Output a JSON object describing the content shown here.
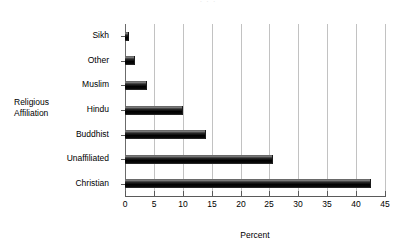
{
  "top_sliver_text": ". . .",
  "axes": {
    "y_title_line1": "Religious",
    "y_title_line2": "Affiliation",
    "x_title": "Percent"
  },
  "chart_data": {
    "type": "bar",
    "orientation": "horizontal",
    "title": "",
    "subtitle": "",
    "xlabel": "Percent",
    "ylabel": "Religious Affiliation",
    "categories": [
      "Sikh",
      "Other",
      "Muslim",
      "Hindu",
      "Buddhist",
      "Unaffiliated",
      "Christian"
    ],
    "values": [
      0.7,
      1.8,
      3.8,
      10.0,
      14.0,
      25.6,
      42.6
    ],
    "xlim": [
      0,
      45
    ],
    "xticks": [
      0,
      5,
      10,
      15,
      20,
      25,
      30,
      35,
      40,
      45
    ],
    "xtick_labels": [
      "0",
      "5",
      "10",
      "15",
      "20",
      "25",
      "30",
      "35",
      "40",
      "45"
    ],
    "grid": "vertical",
    "legend": "none",
    "bar_color": "#000000",
    "gridline_color": "#c2c2c2",
    "axis_color": "#5a5a5a",
    "background_color": "#ffffff"
  }
}
